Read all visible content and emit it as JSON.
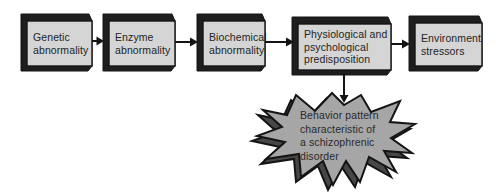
{
  "figure": {
    "name": "schizophrenia-diathesis-stress-flow-diagram",
    "background_color": "#ffffff",
    "box_face_color": "#d5d5d5",
    "box_edge_color": "#1e1e1e",
    "outline_color": "#141414",
    "arrow_color": "#141414",
    "burst_fill_color": "#a6a6a6",
    "burst_shadow_color": "#474747",
    "text_color": "#242424"
  },
  "flow_boxes": [
    {
      "id": "genetic-abnormality",
      "label": "Genetic\nabnormality"
    },
    {
      "id": "enzyme-abnormality",
      "label": "Enzyme\nabnormality"
    },
    {
      "id": "biochemical-abnormality",
      "label": "Biochemical\nabnormality"
    },
    {
      "id": "physiological-psychological-predisposition",
      "label": "Physiological and\npsychological\npredisposition"
    },
    {
      "id": "environment-stressors",
      "label": "Environment\nstressors"
    }
  ],
  "burst": {
    "id": "behavior-pattern-outcome",
    "label": "Behavior pattern\ncharacteristic of\na schizophrenic\ndisorder"
  }
}
